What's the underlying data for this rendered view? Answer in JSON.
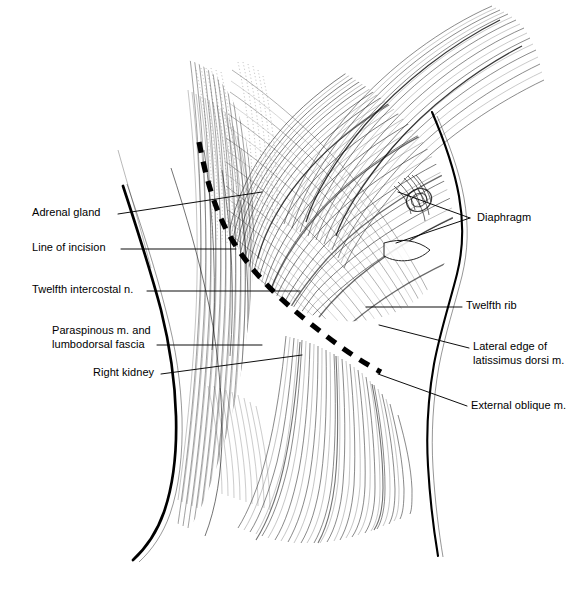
{
  "figure": {
    "background_color": "#ffffff",
    "ink_color": "#000000",
    "width": 586,
    "height": 603,
    "style": "pen-and-ink line drawing with cross-hatch shading"
  },
  "labels": {
    "left": [
      {
        "id": "adrenal-gland",
        "text": "Adrenal gland",
        "x": 32,
        "y": 206,
        "align": "left",
        "leader": {
          "from": [
            118,
            214
          ],
          "to": [
            262,
            192
          ],
          "type": "line"
        }
      },
      {
        "id": "line-of-incision",
        "text": "Line of incision",
        "x": 32,
        "y": 241,
        "align": "left",
        "leader": {
          "from": [
            121,
            249
          ],
          "to": [
            236,
            249
          ],
          "type": "line"
        }
      },
      {
        "id": "twelfth-intercostal-n",
        "text": "Twelfth intercostal n.",
        "x": 32,
        "y": 283,
        "align": "left",
        "leader": {
          "from": [
            147,
            291
          ],
          "to": [
            300,
            291
          ],
          "type": "line"
        }
      },
      {
        "id": "paraspinous-m-and-lumbodorsal-fascia",
        "text": "Paraspinous m. and\nlumbodorsal fascia",
        "x": 52,
        "y": 324,
        "align": "left",
        "leader": {
          "from": [
            157,
            345
          ],
          "to": [
            262,
            345
          ],
          "type": "line"
        }
      },
      {
        "id": "right-kidney",
        "text": "Right kidney",
        "x": 93,
        "y": 366,
        "align": "left",
        "leader": {
          "from": [
            161,
            374
          ],
          "to": [
            302,
            355
          ],
          "type": "line"
        }
      }
    ],
    "right": [
      {
        "id": "diaphragm",
        "text": "Diaphragm",
        "x": 477,
        "y": 211,
        "align": "left",
        "leader": {
          "type": "fork",
          "apex": [
            470,
            218
          ],
          "tips": [
            [
              398,
              192
            ],
            [
              396,
              243
            ]
          ]
        }
      },
      {
        "id": "twelfth-rib",
        "text": "Twelfth rib",
        "x": 466,
        "y": 299,
        "align": "left",
        "leader": {
          "from": [
            462,
            307
          ],
          "to": [
            366,
            307
          ],
          "type": "line"
        }
      },
      {
        "id": "lateral-edge-of-latissimus-dorsi-m",
        "text": "Lateral edge of\nlatissimus dorsi m.",
        "x": 473,
        "y": 340,
        "align": "left",
        "leader": {
          "from": [
            469,
            348
          ],
          "to": [
            379,
            325
          ],
          "type": "line"
        }
      },
      {
        "id": "external-oblique-m",
        "text": "External oblique m.",
        "x": 471,
        "y": 399,
        "align": "left",
        "leader": {
          "from": [
            467,
            406
          ],
          "to": [
            378,
            374
          ],
          "type": "line"
        }
      }
    ]
  },
  "annotations": {
    "incision_line": {
      "name": "line-of-incision-dashed-path",
      "style": "heavy dashed",
      "dash_pattern": "11 9",
      "stroke_width": 5.2,
      "path": "M 199,142 C 206,178 215,213 234,243 C 252,272 276,296 306,320 C 332,341 356,359 381,372"
    },
    "body_outline_left": {
      "name": "posterior-back-contour",
      "stroke_width": 2.6
    },
    "body_outline_right": {
      "name": "lateral-flank-contour",
      "stroke_width": 2.2
    }
  }
}
